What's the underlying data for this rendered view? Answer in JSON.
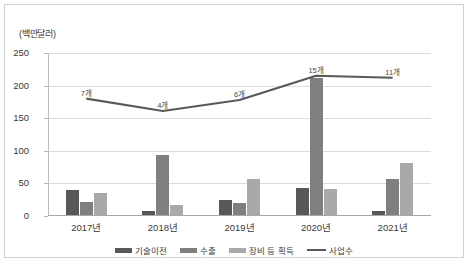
{
  "chart_data": {
    "type": "bar",
    "title": "",
    "unit_label": "(백만달러)",
    "xlabel": "",
    "ylabel": "",
    "ylim": [
      0,
      250
    ],
    "yticks": [
      0,
      50,
      100,
      150,
      200,
      250
    ],
    "grid": true,
    "legend_position": "bottom",
    "categories": [
      "2017년",
      "2018년",
      "2019년",
      "2020년",
      "2021년"
    ],
    "series": [
      {
        "name": "기술이전",
        "type": "bar",
        "color": "#585858",
        "values": [
          40,
          8,
          25,
          43,
          8
        ]
      },
      {
        "name": "수출",
        "type": "bar",
        "color": "#7f7f7f",
        "values": [
          22,
          93,
          20,
          212,
          57
        ]
      },
      {
        "name": "장비 등 획득",
        "type": "bar",
        "color": "#a9a9a9",
        "values": [
          35,
          17,
          57,
          42,
          81
        ]
      },
      {
        "name": "사업수",
        "type": "line",
        "color": "#595959",
        "values": [
          180,
          161,
          178,
          215,
          212
        ],
        "point_labels": [
          "7개",
          "4개",
          "6개",
          "15개",
          "11개"
        ]
      }
    ]
  },
  "legend": {
    "items": [
      {
        "label": "기술이전",
        "color": "#585858",
        "shape": "bar-swatch"
      },
      {
        "label": "수출",
        "color": "#7f7f7f",
        "shape": "bar-swatch"
      },
      {
        "label": "장비 등 획득",
        "color": "#a9a9a9",
        "shape": "bar-swatch"
      },
      {
        "label": "사업수",
        "color": "#595959",
        "shape": "line-swatch"
      }
    ]
  }
}
